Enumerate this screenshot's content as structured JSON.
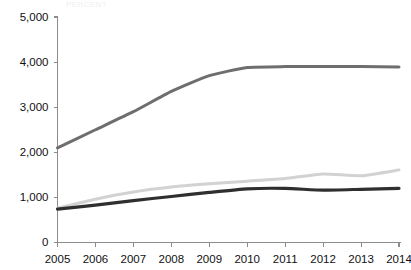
{
  "chart_title_faint": "PERCENT",
  "chart_data": {
    "type": "line",
    "title": "",
    "xlabel": "",
    "ylabel": "",
    "x": [
      2005,
      2006,
      2007,
      2008,
      2009,
      2010,
      2011,
      2012,
      2013,
      2014
    ],
    "categories": [
      "2005",
      "2006",
      "2007",
      "2008",
      "2009",
      "2010",
      "2011",
      "2012",
      "2013",
      "2014"
    ],
    "ylim": [
      0,
      5000
    ],
    "yticks": [
      0,
      1000,
      2000,
      3000,
      4000,
      5000
    ],
    "ytick_labels": [
      "0",
      "1,000",
      "2,000",
      "3,000",
      "4,000",
      "5,000"
    ],
    "xtick_labels": [
      "2005",
      "2006",
      "2007",
      "2008",
      "2009",
      "2010",
      "2011",
      "2012",
      "2013",
      "2014"
    ],
    "grid": false,
    "legend": "none",
    "series": [
      {
        "name": "series-top",
        "color": "#6e6e6e",
        "width": 3.0,
        "values": [
          2100,
          2500,
          2900,
          3350,
          3700,
          3880,
          3900,
          3900,
          3900,
          3890
        ]
      },
      {
        "name": "series-middle",
        "color": "#d2d2d2",
        "width": 3.0,
        "values": [
          760,
          960,
          1120,
          1230,
          1300,
          1360,
          1420,
          1520,
          1480,
          1610
        ]
      },
      {
        "name": "series-bottom",
        "color": "#2f2f2f",
        "width": 3.2,
        "values": [
          740,
          830,
          930,
          1020,
          1110,
          1190,
          1200,
          1160,
          1180,
          1200
        ]
      }
    ]
  },
  "axis": {
    "y_label_texts": [
      "5,000",
      "4,000",
      "3,000",
      "2,000",
      "1,000",
      "0"
    ],
    "x_label_texts": [
      "2005",
      "2006",
      "2007",
      "2008",
      "2009",
      "2010",
      "2011",
      "2012",
      "2013",
      "2014"
    ]
  }
}
